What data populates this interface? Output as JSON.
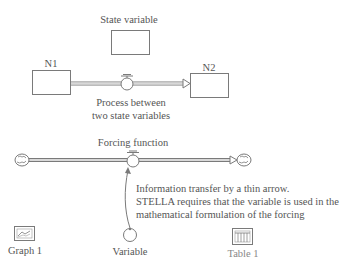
{
  "diagram": {
    "state_variable": {
      "label": "State variable"
    },
    "stocks": [
      {
        "id": "N1",
        "label": "N1"
      },
      {
        "id": "N2",
        "label": "N2"
      }
    ],
    "process_flow": {
      "caption_line1": "Process between",
      "caption_line2": "two state variables"
    },
    "forcing_flow": {
      "label": "Forcing function"
    },
    "info_connector": {
      "line1": "Information transfer by a thin arrow.",
      "line2": "STELLA requires that the variable is used in the",
      "line3": "mathematical formulation of the forcing"
    },
    "converter": {
      "label": "Variable"
    },
    "graph": {
      "label": "Graph 1",
      "icon": "graph-icon"
    },
    "table": {
      "label": "Table 1",
      "icon": "table-icon"
    },
    "colors": {
      "stroke": "#7a7a7a",
      "text": "#555555",
      "pipe_fill": "#d8d8d8"
    }
  }
}
